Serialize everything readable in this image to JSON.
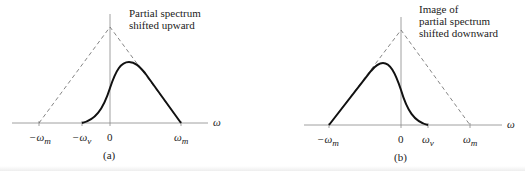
{
  "panels": [
    {
      "id": "a",
      "caption": "(a)",
      "annotation_line1": "Partial spectrum",
      "annotation_line2": "shifted upward",
      "axis_label": "ω",
      "ticks": {
        "neg_m": "−ω",
        "neg_m_sub": "m",
        "neg_v": "−ω",
        "neg_v_sub": "v",
        "zero": "0",
        "pos_m": "ω",
        "pos_m_sub": "m"
      }
    },
    {
      "id": "b",
      "caption": "(b)",
      "annotation_line1": "Image of",
      "annotation_line2": "partial spectrum",
      "annotation_line3": "shifted downward",
      "axis_label": "ω",
      "ticks": {
        "neg_m": "−ω",
        "neg_m_sub": "m",
        "zero": "0",
        "pos_v": "ω",
        "pos_v_sub": "v",
        "pos_m": "ω",
        "pos_m_sub": "m"
      }
    }
  ],
  "colors": {
    "curve": "#111111",
    "axis": "#777777",
    "dashed": "#666666"
  }
}
